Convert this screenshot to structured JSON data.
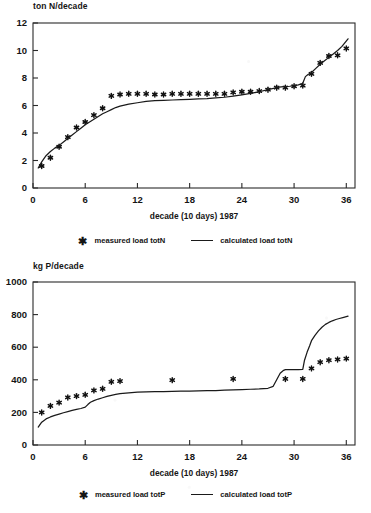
{
  "figure": {
    "xlabel": "decade (10 days) 1987",
    "xticks": [
      0,
      6,
      12,
      18,
      24,
      30,
      36
    ],
    "marker_glyph": "✱",
    "line_color": "#1a1a1a",
    "marker_color": "#111111",
    "axis_color": "#2a2a2a"
  },
  "chart_data": [
    {
      "id": "totN",
      "type": "line",
      "title": "",
      "ylabel": "ton N/decade",
      "xlabel": "decade (10 days) 1987",
      "xlim": [
        0,
        37
      ],
      "ylim": [
        0,
        12
      ],
      "xticks": [
        0,
        6,
        12,
        18,
        24,
        30,
        36
      ],
      "yticks": [
        0,
        2,
        4,
        6,
        8,
        10,
        12
      ],
      "grid": false,
      "legend_position": "below",
      "series": [
        {
          "name": "measured load totN",
          "kind": "scatter",
          "marker": "asterisk",
          "x": [
            1,
            2,
            3,
            4,
            5,
            6,
            7,
            8,
            9,
            10,
            11,
            12,
            13,
            14,
            15,
            16,
            17,
            18,
            19,
            20,
            21,
            22,
            23,
            24,
            25,
            26,
            27,
            28,
            29,
            30,
            31,
            32,
            33,
            34,
            35,
            36
          ],
          "values": [
            1.6,
            2.2,
            3.0,
            3.7,
            4.4,
            4.8,
            5.3,
            5.8,
            6.7,
            6.8,
            6.85,
            6.85,
            6.85,
            6.8,
            6.8,
            6.85,
            6.85,
            6.85,
            6.85,
            6.85,
            6.85,
            6.85,
            6.95,
            7.0,
            7.0,
            7.05,
            7.15,
            7.3,
            7.3,
            7.4,
            7.45,
            8.3,
            9.1,
            9.6,
            9.65,
            10.15
          ]
        },
        {
          "name": "calculated load totN",
          "kind": "line",
          "x": [
            0.6,
            1,
            1.5,
            2,
            2.5,
            3,
            3.5,
            4,
            4.5,
            5,
            5.5,
            6,
            6.5,
            7,
            7.5,
            8,
            8.5,
            9,
            9.5,
            10,
            11,
            12,
            13,
            14,
            15,
            16,
            17,
            18,
            19,
            20,
            21,
            22,
            23,
            24,
            25,
            26,
            27,
            28,
            28.5,
            29,
            29.5,
            30,
            30.5,
            31,
            31.3,
            31.6,
            32,
            32.5,
            33,
            33.5,
            34,
            34.5,
            35,
            35.5,
            36.2
          ],
          "values": [
            1.45,
            1.9,
            2.35,
            2.65,
            2.9,
            3.1,
            3.35,
            3.6,
            3.85,
            4.1,
            4.35,
            4.6,
            4.8,
            5.0,
            5.2,
            5.4,
            5.55,
            5.7,
            5.85,
            5.95,
            6.1,
            6.2,
            6.3,
            6.35,
            6.38,
            6.4,
            6.42,
            6.45,
            6.48,
            6.5,
            6.55,
            6.6,
            6.68,
            6.78,
            6.88,
            7.0,
            7.15,
            7.3,
            7.35,
            7.38,
            7.4,
            7.45,
            7.5,
            7.62,
            8.1,
            8.25,
            8.4,
            8.7,
            9.0,
            9.25,
            9.5,
            9.75,
            10.0,
            10.3,
            10.85
          ]
        }
      ]
    },
    {
      "id": "totP",
      "type": "line",
      "title": "",
      "ylabel": "kg P/decade",
      "xlabel": "decade (10 days) 1987",
      "xlim": [
        0,
        37
      ],
      "ylim": [
        0,
        1000
      ],
      "xticks": [
        0,
        6,
        12,
        18,
        24,
        30,
        36
      ],
      "yticks": [
        0,
        200,
        400,
        600,
        800,
        1000
      ],
      "grid": false,
      "legend_position": "below",
      "series": [
        {
          "name": "measured load totP",
          "kind": "scatter",
          "marker": "asterisk",
          "x": [
            1,
            2,
            3,
            4,
            5,
            6,
            7,
            8,
            9,
            10,
            16,
            23,
            29,
            31,
            32,
            33,
            34,
            35,
            36
          ],
          "values": [
            200,
            240,
            260,
            292,
            300,
            308,
            335,
            345,
            388,
            392,
            398,
            405,
            405,
            405,
            470,
            508,
            520,
            525,
            530
          ]
        },
        {
          "name": "calculated load totP",
          "kind": "line",
          "x": [
            0.6,
            1,
            1.5,
            2,
            2.5,
            3,
            3.5,
            4,
            4.5,
            5,
            5.5,
            6,
            6.3,
            6.6,
            7,
            7.5,
            8,
            8.5,
            9,
            9.5,
            10,
            11,
            12,
            13,
            14,
            15,
            16,
            17,
            18,
            19,
            20,
            21,
            22,
            23,
            24,
            25,
            26,
            27,
            27.6,
            28,
            28.4,
            28.8,
            29,
            29.5,
            30,
            30.5,
            31,
            31.2,
            31.5,
            31.8,
            32,
            32.4,
            32.8,
            33.2,
            33.6,
            34,
            34.4,
            34.8,
            35.2,
            35.6,
            36.2
          ],
          "values": [
            110,
            140,
            160,
            172,
            182,
            190,
            198,
            205,
            212,
            218,
            224,
            232,
            248,
            262,
            272,
            282,
            290,
            298,
            305,
            310,
            315,
            320,
            324,
            326,
            327,
            328,
            329,
            330,
            331,
            332,
            333,
            334,
            336,
            338,
            340,
            342,
            344,
            348,
            360,
            400,
            440,
            458,
            462,
            463,
            463,
            463,
            464,
            520,
            570,
            610,
            640,
            672,
            700,
            722,
            740,
            752,
            762,
            770,
            776,
            782,
            790
          ]
        }
      ]
    }
  ],
  "legends": [
    {
      "measured_label": "measured load totN",
      "calculated_label": "calculated load totN"
    },
    {
      "measured_label": "measured load totP",
      "calculated_label": "calculated load totP"
    }
  ]
}
